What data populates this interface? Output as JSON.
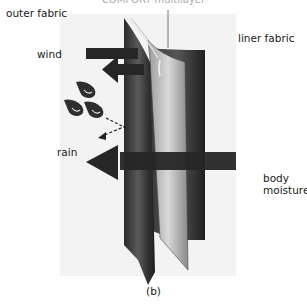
{
  "figure": {
    "top_cropped_text": "COMFORT multilayer",
    "caption": "(b)",
    "labels": {
      "outer_fabric": "outer fabric",
      "liner_fabric": "liner fabric",
      "wind": "wind",
      "rain": "rain",
      "body_moisture_line1": "body",
      "body_moisture_line2": "moisture"
    },
    "colors": {
      "background_panel": "#f2f2f2",
      "fabric_dark": "#2b2b2b",
      "fabric_mid": "#6a6a6a",
      "fabric_light": "#d0d0d0",
      "arrow": "#262626"
    }
  }
}
